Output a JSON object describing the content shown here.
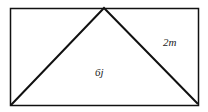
{
  "diagram": {
    "shape": "rectangle with inscribed triangle",
    "labels": {
      "triangle_area": "6j",
      "side": "2m"
    },
    "colors": {
      "stroke": "#111111",
      "background": "#ffffff"
    }
  }
}
